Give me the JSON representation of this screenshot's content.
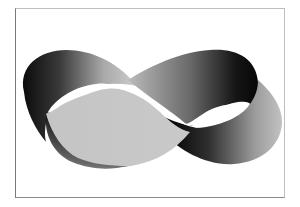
{
  "image": {
    "subject": "Mobius strip shaped as an infinity loop",
    "alt": "Grayscale Mobius strip forming a figure-eight / infinity symbol inside a thin gray frame",
    "colors": {
      "background": "#ffffff",
      "frame": "#8a8a8a",
      "band_dark": "#0d0d0d",
      "band_mid": "#7d7d7d",
      "band_light": "#c8c8c8"
    }
  }
}
